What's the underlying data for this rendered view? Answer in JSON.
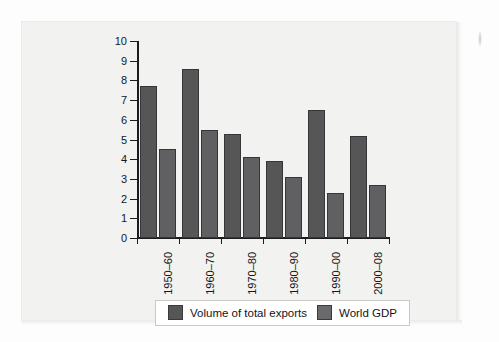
{
  "chart_data": {
    "type": "bar",
    "title": "",
    "xlabel": "",
    "ylabel": "",
    "ylim": [
      0,
      10
    ],
    "yticks": [
      "0",
      "1",
      "2",
      "3",
      "4",
      "5",
      "6",
      "7",
      "8",
      "9",
      "10"
    ],
    "grid": false,
    "legend_position": "bottom",
    "categories": [
      "1950–60",
      "1960–70",
      "1970–80",
      "1980–90",
      "1990–00",
      "2000–08"
    ],
    "series": [
      {
        "name": "Volume of total exports",
        "color": "#565656",
        "values": [
          7.7,
          8.6,
          5.3,
          3.9,
          6.5,
          5.2
        ]
      },
      {
        "name": "World GDP",
        "color": "#6a6a6d",
        "values": [
          4.5,
          5.5,
          4.1,
          3.1,
          2.3,
          2.7
        ]
      }
    ]
  },
  "legend": {
    "entries": [
      {
        "label": "Volume of total exports"
      },
      {
        "label": "World GDP"
      }
    ]
  }
}
